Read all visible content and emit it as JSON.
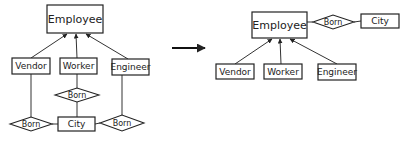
{
  "diagram": {
    "type": "er-diagram-transformation",
    "before": {
      "entities": {
        "employee": "Employee",
        "vendor": "Vendor",
        "worker": "Worker",
        "engineer": "Engineer",
        "city": "City"
      },
      "relationships": {
        "born_vendor": "Born",
        "born_worker": "Born",
        "born_engineer": "Born"
      },
      "edges": [
        {
          "from": "Vendor",
          "to": "Employee",
          "kind": "is-a arrow"
        },
        {
          "from": "Worker",
          "to": "Employee",
          "kind": "is-a arrow"
        },
        {
          "from": "Engineer",
          "to": "Employee",
          "kind": "is-a arrow"
        },
        {
          "from": "Vendor",
          "to": "Born"
        },
        {
          "from": "Worker",
          "to": "Born"
        },
        {
          "from": "Engineer",
          "to": "Born"
        },
        {
          "from": "Born",
          "to": "City"
        }
      ]
    },
    "transform_arrow": "→",
    "after": {
      "entities": {
        "employee": "Employee",
        "vendor": "Vendor",
        "worker": "Worker",
        "engineer": "Engineer",
        "city": "City"
      },
      "relationships": {
        "born": "Born"
      },
      "edges": [
        {
          "from": "Vendor",
          "to": "Employee",
          "kind": "is-a arrow"
        },
        {
          "from": "Worker",
          "to": "Employee",
          "kind": "is-a arrow"
        },
        {
          "from": "Engineer",
          "to": "Employee",
          "kind": "is-a arrow"
        },
        {
          "from": "Employee",
          "to": "Born"
        },
        {
          "from": "Born",
          "to": "City"
        }
      ]
    },
    "colors": {
      "stroke": "#222222",
      "background": "#ffffff"
    }
  }
}
